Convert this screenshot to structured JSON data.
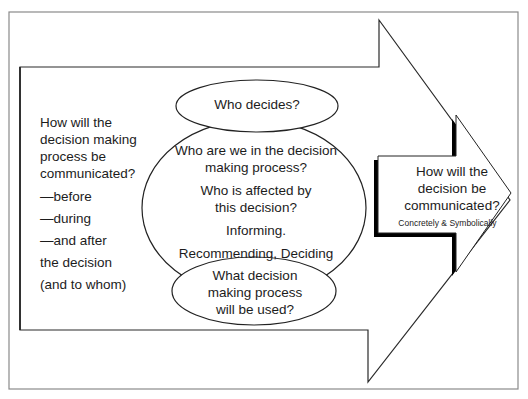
{
  "diagram": {
    "type": "flow-arrows-with-ellipses",
    "colors": {
      "stroke": "#222222",
      "frame": "#888888",
      "shadow": "#000000",
      "background": "#ffffff"
    },
    "big_arrow": {
      "left_text": {
        "lines": [
          "How will the",
          "decision making",
          "process be",
          "communicated?",
          "—before",
          "—during",
          "—and after",
          "the decision",
          "(and to whom)"
        ]
      }
    },
    "ellipses": {
      "top": {
        "label": "Who decides?"
      },
      "middle": {
        "line1": "Who are we in the decision",
        "line2": "making process?",
        "line3": "Who is affected by",
        "line4": "this decision?",
        "line5": "Informing.",
        "line6": "Recommending, Deciding"
      },
      "bottom": {
        "line1": "What decision",
        "line2": "making process",
        "line3": "will be used?"
      }
    },
    "small_arrow": {
      "line1": "How will the",
      "line2": "decision be",
      "line3": "communicated?",
      "subtitle": "Concretely & Symbolically"
    }
  }
}
